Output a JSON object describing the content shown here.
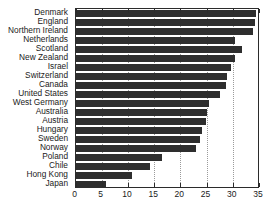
{
  "chart_data": {
    "type": "bar",
    "orientation": "horizontal",
    "title": "",
    "subtitle": "",
    "xlabel": "",
    "ylabel": "",
    "xlim": [
      0,
      35
    ],
    "ylim": null,
    "xticks": [
      0,
      5,
      10,
      15,
      20,
      25,
      30,
      35
    ],
    "xtick_labels": [
      "0",
      "5",
      "10",
      "15",
      "20",
      "25",
      "30",
      "35"
    ],
    "grid": "vertical-dotted",
    "legend": null,
    "bar_color": "#2e2e2e",
    "axis_color": "#2b2b2b",
    "grid_color": "#9a9a9a",
    "categories": [
      "Denmark",
      "England",
      "Northern Ireland",
      "Netherlands",
      "Scotland",
      "New Zealand",
      "Israel",
      "Switzerland",
      "Canada",
      "United States",
      "West Germany",
      "Australia",
      "Austria",
      "Hungary",
      "Sweden",
      "Norway",
      "Poland",
      "Chile",
      "Hong Kong",
      "Japan"
    ],
    "values": [
      34.4,
      34.3,
      33.9,
      30.4,
      31.8,
      30.4,
      29.6,
      28.9,
      28.7,
      27.5,
      25.4,
      25.1,
      24.9,
      24.1,
      23.8,
      22.9,
      16.5,
      14.3,
      10.8,
      5.9
    ]
  }
}
